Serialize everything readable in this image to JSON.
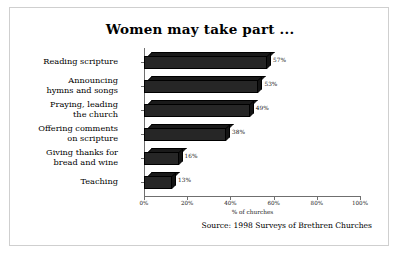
{
  "chart_data": {
    "type": "bar",
    "orientation": "horizontal",
    "title": "Women may take part ...",
    "categories": [
      "Reading scripture",
      "Announcing\nhymns and songs",
      "Praying, leading\nthe church",
      "Offering comments\non scripture",
      "Giving thanks for\nbread and wine",
      "Teaching"
    ],
    "values": [
      57,
      53,
      49,
      38,
      16,
      13
    ],
    "value_labels": [
      "57%",
      "53%",
      "49%",
      "38%",
      "16%",
      "13%"
    ],
    "xlabel": "% of churches",
    "ylabel": "",
    "xlim": [
      0,
      100
    ],
    "xticks": [
      0,
      20,
      40,
      60,
      80,
      100
    ],
    "xtick_labels": [
      "0%",
      "20%",
      "40%",
      "60%",
      "80%",
      "100%"
    ],
    "grid": false,
    "legend": false,
    "bar_color": "#262626",
    "style": "3d-bar"
  },
  "source": {
    "note": "Source: 1998 Surveys of Brethren Churches"
  }
}
